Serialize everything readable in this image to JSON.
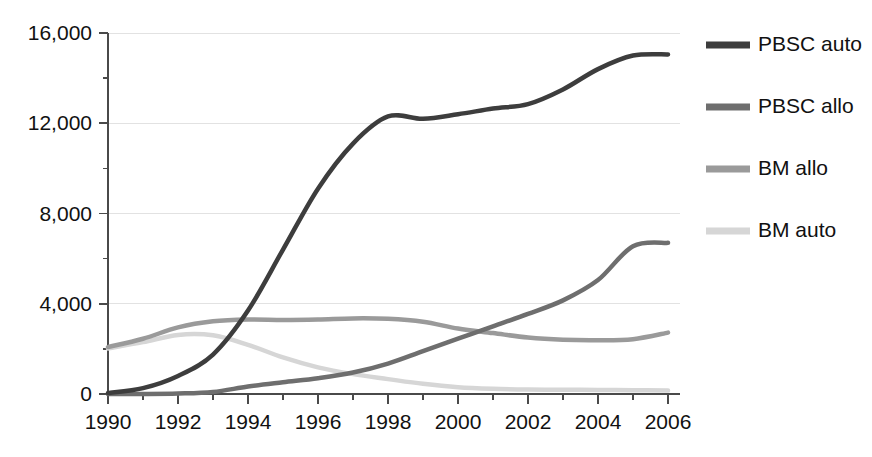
{
  "chart_data": {
    "type": "line",
    "title": "",
    "subtitle": "",
    "xlabel": "",
    "ylabel": "",
    "xlim": [
      1990,
      2006
    ],
    "ylim": [
      0,
      16000
    ],
    "grid": true,
    "legend_position": "right",
    "x_ticks_major": [
      1990,
      1992,
      1994,
      1996,
      1998,
      2000,
      2002,
      2004,
      2006
    ],
    "x_ticks_minor": [
      1991,
      1993,
      1995,
      1997,
      1999,
      2001,
      2003,
      2005
    ],
    "x_tick_labels": [
      "1990",
      "1992",
      "1994",
      "1996",
      "1998",
      "2000",
      "2002",
      "2004",
      "2006"
    ],
    "y_ticks_major": [
      0,
      4000,
      8000,
      12000,
      16000
    ],
    "y_ticks_minor": [
      2000,
      6000,
      10000,
      14000
    ],
    "y_tick_labels": [
      "0",
      "4,000",
      "8,000",
      "12,000",
      "16,000"
    ],
    "x": [
      1990,
      1991,
      1992,
      1993,
      1994,
      1995,
      1996,
      1997,
      1998,
      1999,
      2000,
      2001,
      2002,
      2003,
      2004,
      2005,
      2006
    ],
    "series": [
      {
        "name": "PBSC auto",
        "color": "#3d3d3d",
        "width": 4.5,
        "values": [
          40,
          260,
          800,
          1750,
          3700,
          6400,
          9100,
          11100,
          12300,
          12200,
          12400,
          12650,
          12850,
          13500,
          14400,
          15000,
          15050
        ]
      },
      {
        "name": "PBSC allo",
        "color": "#6e6e6e",
        "width": 4.5,
        "values": [
          0,
          0,
          20,
          90,
          330,
          520,
          700,
          950,
          1350,
          1900,
          2450,
          3000,
          3550,
          4150,
          5050,
          6550,
          6700
        ]
      },
      {
        "name": "BM allo",
        "color": "#9a9a9a",
        "width": 4.5,
        "values": [
          2080,
          2450,
          2950,
          3220,
          3300,
          3280,
          3300,
          3350,
          3330,
          3200,
          2900,
          2700,
          2500,
          2400,
          2380,
          2430,
          2720
        ]
      },
      {
        "name": "BM auto",
        "color": "#d6d6d6",
        "width": 4.5,
        "values": [
          2020,
          2300,
          2620,
          2600,
          2180,
          1620,
          1180,
          880,
          660,
          450,
          300,
          230,
          200,
          190,
          180,
          170,
          150
        ]
      }
    ]
  },
  "legend": {
    "items": [
      {
        "label": "PBSC auto",
        "color": "#3d3d3d"
      },
      {
        "label": "PBSC allo",
        "color": "#6e6e6e"
      },
      {
        "label": "BM allo",
        "color": "#9a9a9a"
      },
      {
        "label": "BM auto",
        "color": "#d6d6d6"
      }
    ]
  },
  "axes": {
    "y_labels": [
      "16,000",
      "12,000",
      "8,000",
      "4,000",
      "0"
    ],
    "x_labels": [
      "1990",
      "1992",
      "1994",
      "1996",
      "1998",
      "2000",
      "2002",
      "2004",
      "2006"
    ]
  },
  "caption": {
    "sliver_text": ""
  }
}
